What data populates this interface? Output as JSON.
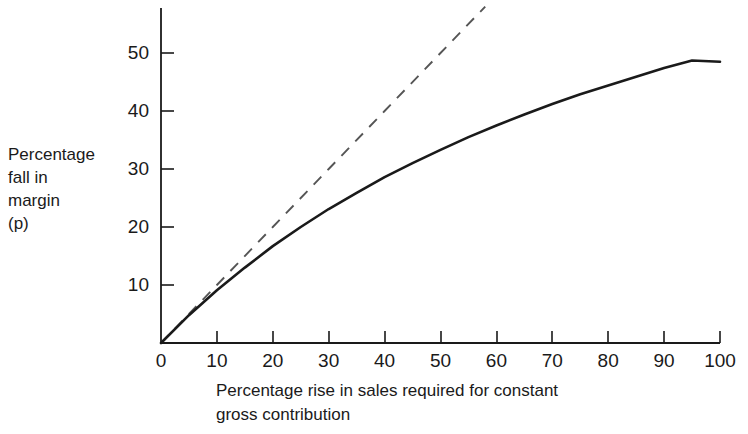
{
  "chart_data": {
    "type": "line",
    "title": "",
    "xlabel": "Percentage rise in sales required for constant gross contribution",
    "xlabel_lines": [
      "Percentage rise in sales required for constant",
      "gross contribution"
    ],
    "ylabel": "Percentage fall in margin (p)",
    "ylabel_lines": [
      "Percentage",
      "fall in",
      "margin",
      "(p)"
    ],
    "xlim": [
      0,
      100
    ],
    "ylim": [
      0,
      57
    ],
    "xticks": [
      0,
      10,
      20,
      30,
      40,
      50,
      60,
      70,
      80,
      90,
      100
    ],
    "xtick_labels": [
      "0",
      "10",
      "20",
      "30",
      "40",
      "50",
      "60",
      "70",
      "80",
      "90",
      "100"
    ],
    "yticks": [
      10,
      20,
      30,
      40,
      50
    ],
    "ytick_labels": [
      "10",
      "20",
      "30",
      "40",
      "50"
    ],
    "grid": false,
    "legend": "none",
    "series": [
      {
        "name": "actual-curve",
        "style": "solid",
        "color": "#1a1a1a",
        "x": [
          0,
          5,
          10,
          15,
          20,
          25,
          30,
          35,
          40,
          45,
          50,
          55,
          60,
          65,
          70,
          75,
          80,
          85,
          90,
          95,
          100
        ],
        "values": [
          0,
          4.8,
          9.1,
          13.0,
          16.7,
          20.0,
          23.1,
          25.9,
          28.6,
          31.0,
          33.3,
          35.5,
          37.5,
          39.4,
          41.2,
          42.9,
          44.4,
          45.9,
          47.4,
          48.7,
          48.5
        ]
      },
      {
        "name": "reference-line",
        "style": "dashed",
        "color": "#555555",
        "x": [
          0,
          10,
          20,
          30,
          40,
          50,
          58
        ],
        "values": [
          0,
          10,
          20,
          30,
          40,
          50,
          58
        ]
      }
    ],
    "axis_color": "#1a1a1a"
  },
  "axes_geometry": {
    "origin_x": 161,
    "origin_y": 343,
    "x_max_px": 720,
    "y_axis_top_px": 8,
    "px_per_x_unit": 5.59,
    "px_per_y_unit": 5.8
  }
}
